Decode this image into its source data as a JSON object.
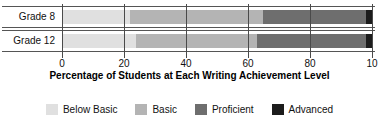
{
  "chart_data": {
    "type": "bar",
    "orientation": "horizontal",
    "stacked": true,
    "title": "",
    "xlabel": "Percentage of Students at Each Writing Achievement Level",
    "ylabel": "",
    "xlim": [
      0,
      100
    ],
    "grid": true,
    "legend_position": "bottom",
    "categories": [
      "Grade 8",
      "Grade 12"
    ],
    "xticks": [
      0,
      20,
      40,
      60,
      80,
      100
    ],
    "xtick_labels": [
      "0",
      "20",
      "40",
      "60",
      "80",
      "10"
    ],
    "series": [
      {
        "name": "Below Basic",
        "color": "#e0e0e0",
        "values": [
          22,
          24
        ]
      },
      {
        "name": "Basic",
        "color": "#b4b4b4",
        "values": [
          43,
          39
        ]
      },
      {
        "name": "Proficient",
        "color": "#6e6e6e",
        "values": [
          33,
          35
        ]
      },
      {
        "name": "Advanced",
        "color": "#1c1c1c",
        "values": [
          2,
          2
        ]
      }
    ]
  },
  "axis": {
    "title": "Percentage of Students at Each Writing Achievement Level"
  },
  "rows": [
    {
      "label": "Grade 8"
    },
    {
      "label": "Grade 12"
    }
  ],
  "legend": {
    "items": [
      {
        "label": "Below Basic",
        "color": "#e0e0e0"
      },
      {
        "label": "Basic",
        "color": "#b4b4b4"
      },
      {
        "label": "Proficient",
        "color": "#6e6e6e"
      },
      {
        "label": "Advanced",
        "color": "#1c1c1c"
      }
    ]
  }
}
